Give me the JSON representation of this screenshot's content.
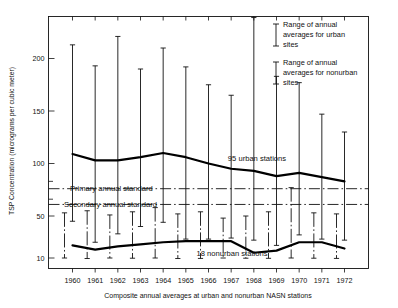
{
  "chart_data": {
    "type": "line",
    "title": "",
    "subtitle": "",
    "xlabel": "Composite annual averages at urban and nonurban NASN stations",
    "ylabel": "TSP Concentration (micrograms per cubic meter)",
    "x": [
      1960,
      1961,
      1962,
      1963,
      1964,
      1965,
      1966,
      1967,
      1968,
      1969,
      1970,
      1971,
      1972
    ],
    "categories": [
      "1960",
      "1961",
      "1962",
      "1963",
      "1964",
      "1965",
      "1966",
      "1967",
      "1968",
      "1969",
      "1970",
      "1971",
      "1972"
    ],
    "ylim": [
      0,
      240
    ],
    "ytick_values": [
      10,
      50,
      100,
      150,
      200
    ],
    "ytick_labels": [
      "10",
      "50",
      "100",
      "150",
      "200"
    ],
    "yminor_values": [
      66,
      83
    ],
    "grid": false,
    "legend_position": "top-right",
    "series": [
      {
        "name": "95 urban stations",
        "label_in_plot": "95 urban stations",
        "values": [
          109,
          103,
          103,
          106,
          110,
          106,
          100,
          95,
          93,
          88,
          91,
          87,
          83
        ],
        "range_low": [
          45,
          25,
          33,
          40,
          44,
          28,
          28,
          29,
          27,
          22,
          32,
          28,
          27
        ],
        "range_high": [
          213,
          193,
          221,
          190,
          210,
          192,
          175,
          165,
          239,
          183,
          177,
          147,
          130
        ]
      },
      {
        "name": "18 nonurban stations",
        "label_in_plot": "18 nonurban stations",
        "values": [
          22,
          18,
          21,
          23,
          25,
          26,
          26,
          26,
          15,
          17,
          25,
          25,
          19
        ],
        "range_low": [
          10,
          9.5,
          10,
          9.8,
          10,
          9.5,
          9.6,
          10,
          9.8,
          9.7,
          10,
          9.8,
          9.6
        ],
        "range_high": [
          53,
          55,
          51,
          54,
          58,
          52,
          54,
          48,
          50,
          54,
          77,
          53,
          52
        ]
      }
    ],
    "reference_lines": [
      {
        "name": "primary-annual-standard",
        "label": "Primary annual standard",
        "value": 76,
        "style": "dash-dot"
      },
      {
        "name": "secondary-annual-standard",
        "label": "Secondary annual standard",
        "value": 61,
        "style": "dash-dot"
      }
    ],
    "legend": [
      {
        "key": "urban-range",
        "label": "Range of annual averages for urban sites"
      },
      {
        "key": "nonurban-range",
        "label": "Range of annual averages for nonurban sites"
      }
    ],
    "annotations": [
      {
        "name": "urban-series-label",
        "text": "95 urban stations"
      },
      {
        "name": "nonurban-series-label",
        "text": "18 nonurban stations"
      }
    ]
  },
  "axes": {
    "y_title": "TSP Concentration (micrograms per cubic meter)",
    "x_caption": "Composite annual averages at urban and nonurban NASN stations"
  },
  "legend": {
    "urban_line1": "Range of annual",
    "urban_line2": "averages for urban",
    "urban_line3": "sites",
    "nonurban_line1": "Range of annual",
    "nonurban_line2": "averages for nonurban",
    "nonurban_line3": "sites"
  },
  "labels": {
    "primary_standard": "Primary annual standard",
    "secondary_standard": "Secondary annual standard",
    "urban_stations": "95 urban stations",
    "nonurban_stations": "18 nonurban stations"
  },
  "colors": {
    "ink": "#111111",
    "series": "#000000",
    "background": "#ffffff"
  }
}
